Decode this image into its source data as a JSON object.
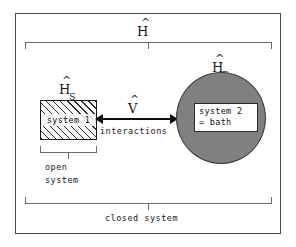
{
  "diagram": {
    "title_hamiltonian": {
      "base": "H",
      "sub": ""
    },
    "subsystem_hamiltonian": {
      "base": "H",
      "sub": "S"
    },
    "bath_hamiltonian": {
      "base": "H",
      "sub": "B"
    },
    "interaction_operator": {
      "base": "V",
      "sub": ""
    },
    "system1_label": "system 1",
    "system2_label_line1": "system 2",
    "system2_label_line2": "= bath",
    "interactions_label": "interactions",
    "open_system_line1": "open",
    "open_system_line2": "system",
    "closed_system_label": "closed system",
    "colors": {
      "bath_fill": "#808080",
      "frame": "#4a4a4a",
      "bracket": "#6a6a6a",
      "arrow": "#111111",
      "hatch": "#2b2b2b",
      "background": "#ffffff"
    }
  }
}
